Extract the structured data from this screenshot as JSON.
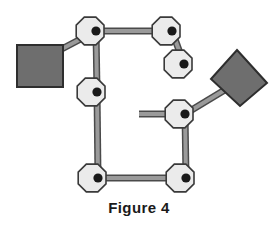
{
  "figure": {
    "caption": "Figure 4",
    "canvas": {
      "width": 278,
      "height": 237,
      "background": "#ffffff"
    }
  },
  "style": {
    "node_fill": "#ebebeb",
    "node_stroke": "#3a3a3a",
    "node_hub_fill": "#1a1a1a",
    "edge_fill": "#9a9a9a",
    "edge_stroke": "#4a4a4a",
    "block_fill": "#6e6e6e",
    "block_stroke": "#2e2e2e",
    "caption_color": "#1a1a1a"
  },
  "diagram": {
    "type": "node-link-graph",
    "node_radius": 14,
    "node_sides": 8,
    "hub_radius": 4.6,
    "edge_width": 5,
    "nodes": [
      {
        "id": "n1",
        "label": "node-top-left",
        "x": 96,
        "y": 31
      },
      {
        "id": "n2",
        "label": "node-top-right",
        "x": 172,
        "y": 31
      },
      {
        "id": "n3",
        "label": "node-pendant-right",
        "x": 184,
        "y": 64
      },
      {
        "id": "n4",
        "label": "node-middle-left",
        "x": 97,
        "y": 92
      },
      {
        "id": "n5",
        "label": "node-middle-right",
        "x": 185,
        "y": 114
      },
      {
        "id": "n6",
        "label": "node-bottom-left",
        "x": 98,
        "y": 178
      },
      {
        "id": "n7",
        "label": "node-bottom-right",
        "x": 186,
        "y": 178
      }
    ],
    "edges": [
      {
        "id": "e1",
        "label": "edge-top-left-to-top-right",
        "from": "n1",
        "to": "n2"
      },
      {
        "id": "e2",
        "label": "edge-top-right-to-pendant",
        "from": "n2",
        "to": "n3"
      },
      {
        "id": "e3",
        "label": "edge-top-left-to-middle-left",
        "from": "n1",
        "to": "n4"
      },
      {
        "id": "e4",
        "label": "edge-middle-left-to-bottom-left",
        "from": "n4",
        "to": "n6"
      },
      {
        "id": "e5",
        "label": "edge-bottom-left-to-bottom-right",
        "from": "n6",
        "to": "n7"
      },
      {
        "id": "e6",
        "label": "edge-bottom-right-to-middle-right",
        "from": "n7",
        "to": "n5"
      },
      {
        "id": "e7",
        "label": "edge-top-left-to-square-block",
        "from": "n1",
        "to": "sq"
      },
      {
        "id": "e8",
        "label": "edge-middle-right-to-kite-block",
        "from": "n5",
        "to": "kite"
      },
      {
        "id": "e9",
        "label": "edge-middle-right-stub-left",
        "from": "n5",
        "to": "stub"
      }
    ],
    "blocks": [
      {
        "id": "sq",
        "label": "square-block-left",
        "shape": "rectangle",
        "x": 17,
        "y": 45,
        "width": 46,
        "height": 42
      },
      {
        "id": "kite",
        "label": "kite-block-right",
        "shape": "quadrilateral",
        "points": "237,50 267,83 240,106 211,79"
      }
    ],
    "stub_endpoint": {
      "x": 139,
      "y": 114
    }
  }
}
